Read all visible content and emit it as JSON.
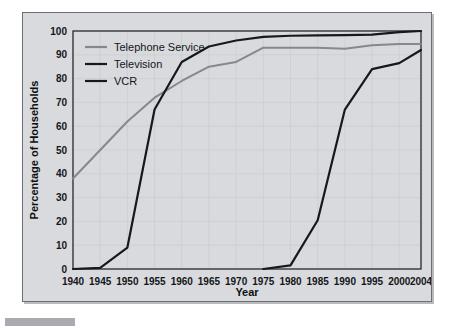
{
  "chart_data": {
    "type": "line",
    "title": "",
    "xlabel": "Year",
    "ylabel": "Percentage of Households",
    "xlim": [
      1940,
      2004
    ],
    "ylim": [
      0,
      100
    ],
    "grid": true,
    "legend_position": "top-left",
    "xticks": [
      1940,
      1945,
      1950,
      1955,
      1960,
      1965,
      1970,
      1975,
      1980,
      1985,
      1990,
      1995,
      2000,
      2004
    ],
    "yticks": [
      0,
      10,
      20,
      30,
      40,
      50,
      60,
      70,
      80,
      90,
      100
    ],
    "series": [
      {
        "name": "Telephone Service",
        "color": "#84898f",
        "width": 2.0,
        "x": [
          1940,
          1945,
          1950,
          1955,
          1960,
          1965,
          1970,
          1975,
          1980,
          1985,
          1990,
          1995,
          2000,
          2004
        ],
        "values": [
          38,
          50,
          62,
          72,
          79,
          85,
          87,
          93,
          93,
          93,
          92.5,
          94,
          94.5,
          94.5
        ]
      },
      {
        "name": "Television",
        "color": "#16181c",
        "width": 2.2,
        "x": [
          1940,
          1945,
          1950,
          1955,
          1960,
          1965,
          1970,
          1975,
          1980,
          1985,
          1990,
          1995,
          2000,
          2004
        ],
        "values": [
          0,
          0.5,
          9,
          67,
          87,
          93.5,
          96,
          97.5,
          98,
          98.2,
          98.3,
          98.5,
          99.5,
          100
        ]
      },
      {
        "name": "VCR",
        "color": "#16181c",
        "width": 2.2,
        "x": [
          1975,
          1980,
          1985,
          1990,
          1995,
          2000,
          2004
        ],
        "values": [
          0,
          1.5,
          20.5,
          67,
          84,
          86.5,
          92
        ]
      }
    ]
  },
  "legend": {
    "items": [
      {
        "label": "Telephone Service",
        "color": "#84898f"
      },
      {
        "label": "Television",
        "color": "#16181c"
      },
      {
        "label": "VCR",
        "color": "#16181c"
      }
    ]
  }
}
